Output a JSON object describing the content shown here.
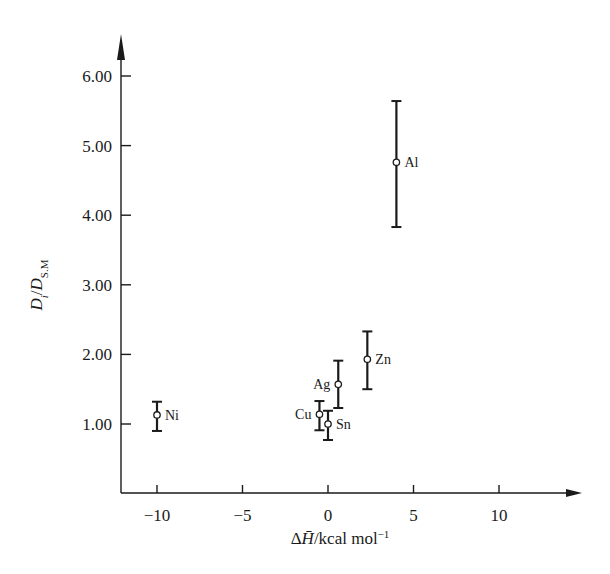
{
  "chart_data": {
    "type": "scatter",
    "title": "",
    "xlabel": "ΔH̄/kcal mol⁻¹",
    "ylabel": "Dᵢ/D_S.M",
    "xlim": [
      -12,
      14
    ],
    "ylim": [
      0,
      6.6
    ],
    "xticks": [
      -10,
      -5,
      0,
      5,
      10
    ],
    "xtick_labels": [
      "−10",
      "−5",
      "0",
      "5",
      "10"
    ],
    "yticks": [
      1,
      2,
      3,
      4,
      5,
      6
    ],
    "ytick_labels": [
      "1.00",
      "2.00",
      "3.00",
      "4.00",
      "5.00",
      "6.00"
    ],
    "grid": false,
    "legend": null,
    "points": [
      {
        "label": "Ni",
        "x": -10,
        "y": 1.13,
        "y_low": 0.9,
        "y_high": 1.32,
        "label_side": "right"
      },
      {
        "label": "Cu",
        "x": -0.5,
        "y": 1.14,
        "y_low": 0.91,
        "y_high": 1.33,
        "label_side": "left"
      },
      {
        "label": "Sn",
        "x": 0,
        "y": 1.0,
        "y_low": 0.77,
        "y_high": 1.19,
        "label_side": "right"
      },
      {
        "label": "Ag",
        "x": 0.6,
        "y": 1.57,
        "y_low": 1.23,
        "y_high": 1.91,
        "label_side": "left"
      },
      {
        "label": "Zn",
        "x": 2.3,
        "y": 1.93,
        "y_low": 1.5,
        "y_high": 2.33,
        "label_side": "right"
      },
      {
        "label": "Al",
        "x": 4.0,
        "y": 4.76,
        "y_low": 3.83,
        "y_high": 5.64,
        "label_side": "right"
      }
    ]
  }
}
